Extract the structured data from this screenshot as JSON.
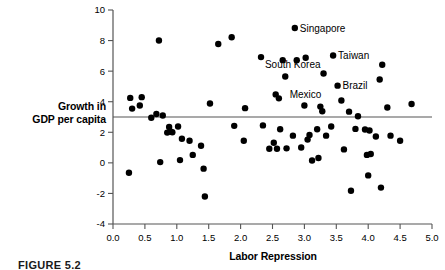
{
  "figure": {
    "caption": "FIGURE 5.2"
  },
  "axes": {
    "x_title": "Labor Repression",
    "y_title_line1": "Growth in",
    "y_title_line2": "GDP per capita",
    "x_ticks": [
      "0.0",
      "0.5",
      "1.0",
      "1.5",
      "2.0",
      "2.5",
      "3.0",
      "3.5",
      "4.0",
      "4.5",
      "5.0"
    ],
    "y_ticks": [
      "10",
      "8",
      "6",
      "4",
      "2",
      "0",
      "-2",
      "-4"
    ]
  },
  "chart_data": {
    "type": "scatter",
    "title": "",
    "xlabel": "Labor Repression",
    "ylabel": "Growth in GDP per capita",
    "xlim": [
      0.0,
      5.0
    ],
    "ylim": [
      -4,
      10
    ],
    "x_tick_values": [
      0.0,
      0.5,
      1.0,
      1.5,
      2.0,
      2.5,
      3.0,
      3.5,
      4.0,
      4.5,
      5.0
    ],
    "y_tick_values": [
      -4,
      -2,
      0,
      2,
      4,
      6,
      8,
      10
    ],
    "grid": false,
    "legend": null,
    "reference_line": {
      "orientation": "horizontal",
      "y": 3.0,
      "color": "#555555"
    },
    "marker": {
      "shape": "circle",
      "color": "#000000",
      "size": 3.2
    },
    "points": [
      {
        "x": 0.25,
        "y": -0.65
      },
      {
        "x": 0.27,
        "y": 4.25
      },
      {
        "x": 0.3,
        "y": 3.55
      },
      {
        "x": 0.42,
        "y": 3.75
      },
      {
        "x": 0.45,
        "y": 4.3
      },
      {
        "x": 0.6,
        "y": 2.95
      },
      {
        "x": 0.68,
        "y": 3.2
      },
      {
        "x": 0.72,
        "y": 8.0
      },
      {
        "x": 0.74,
        "y": 0.05
      },
      {
        "x": 0.78,
        "y": 3.1
      },
      {
        "x": 0.85,
        "y": 1.98
      },
      {
        "x": 0.88,
        "y": 2.35
      },
      {
        "x": 0.9,
        "y": 2.05
      },
      {
        "x": 0.93,
        "y": 2.0
      },
      {
        "x": 1.02,
        "y": 2.38
      },
      {
        "x": 1.05,
        "y": 0.18
      },
      {
        "x": 1.08,
        "y": 1.58
      },
      {
        "x": 1.2,
        "y": 1.45
      },
      {
        "x": 1.25,
        "y": 0.52
      },
      {
        "x": 1.38,
        "y": 1.12
      },
      {
        "x": 1.42,
        "y": -0.38
      },
      {
        "x": 1.44,
        "y": -2.2
      },
      {
        "x": 1.52,
        "y": 3.88
      },
      {
        "x": 1.65,
        "y": 7.78
      },
      {
        "x": 1.86,
        "y": 8.22
      },
      {
        "x": 1.9,
        "y": 2.42
      },
      {
        "x": 2.05,
        "y": 1.45
      },
      {
        "x": 2.07,
        "y": 3.58
      },
      {
        "x": 2.32,
        "y": 6.92
      },
      {
        "x": 2.35,
        "y": 2.45
      },
      {
        "x": 2.45,
        "y": 0.92
      },
      {
        "x": 2.52,
        "y": 1.32
      },
      {
        "x": 2.55,
        "y": 4.48
      },
      {
        "x": 2.57,
        "y": 0.92
      },
      {
        "x": 2.6,
        "y": 4.22
      },
      {
        "x": 2.62,
        "y": 2.2
      },
      {
        "x": 2.66,
        "y": 6.72
      },
      {
        "x": 2.7,
        "y": 5.65
      },
      {
        "x": 2.72,
        "y": 0.95
      },
      {
        "x": 2.82,
        "y": 1.78
      },
      {
        "x": 2.85,
        "y": 8.82
      },
      {
        "x": 2.88,
        "y": 6.72
      },
      {
        "x": 2.95,
        "y": 1.0
      },
      {
        "x": 3.0,
        "y": 3.75
      },
      {
        "x": 3.02,
        "y": 6.88
      },
      {
        "x": 3.05,
        "y": 1.52
      },
      {
        "x": 3.08,
        "y": 1.82
      },
      {
        "x": 3.12,
        "y": 0.15
      },
      {
        "x": 3.2,
        "y": 2.2
      },
      {
        "x": 3.22,
        "y": 0.32
      },
      {
        "x": 3.25,
        "y": 3.68
      },
      {
        "x": 3.28,
        "y": 3.38
      },
      {
        "x": 3.3,
        "y": 5.85
      },
      {
        "x": 3.34,
        "y": 1.78
      },
      {
        "x": 3.42,
        "y": 2.38
      },
      {
        "x": 3.45,
        "y": 7.02
      },
      {
        "x": 3.52,
        "y": 5.05
      },
      {
        "x": 3.58,
        "y": 4.08
      },
      {
        "x": 3.62,
        "y": 0.88
      },
      {
        "x": 3.7,
        "y": 3.35
      },
      {
        "x": 3.73,
        "y": -1.82
      },
      {
        "x": 3.8,
        "y": 2.22
      },
      {
        "x": 3.84,
        "y": 3.05
      },
      {
        "x": 3.95,
        "y": 2.18
      },
      {
        "x": 3.98,
        "y": 0.52
      },
      {
        "x": 4.0,
        "y": -0.82
      },
      {
        "x": 4.02,
        "y": 2.12
      },
      {
        "x": 4.04,
        "y": 0.58
      },
      {
        "x": 4.12,
        "y": 1.72
      },
      {
        "x": 4.18,
        "y": 5.45
      },
      {
        "x": 4.2,
        "y": -1.62
      },
      {
        "x": 4.22,
        "y": 6.42
      },
      {
        "x": 4.3,
        "y": 3.62
      },
      {
        "x": 4.35,
        "y": 1.78
      },
      {
        "x": 4.5,
        "y": 1.45
      },
      {
        "x": 4.68,
        "y": 3.85
      }
    ],
    "annotations": [
      {
        "label": "Singapore",
        "x": 2.85,
        "y": 8.82,
        "position": "right"
      },
      {
        "label": "Taiwan",
        "x": 3.45,
        "y": 7.02,
        "position": "right"
      },
      {
        "label": "South Korea",
        "x": 3.3,
        "y": 5.85,
        "position": "left-above"
      },
      {
        "label": "Brazil",
        "x": 3.52,
        "y": 5.05,
        "position": "right"
      },
      {
        "label": "Mexico",
        "x": 2.55,
        "y": 4.48,
        "position": "right-gap"
      }
    ]
  }
}
